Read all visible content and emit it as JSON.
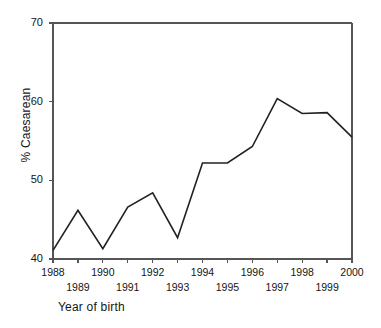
{
  "chart_data": {
    "type": "line",
    "title": "",
    "xlabel": "Year of birth",
    "ylabel": "% Caesarean",
    "x": [
      1988,
      1989,
      1990,
      1991,
      1992,
      1993,
      1994,
      1995,
      1996,
      1997,
      1998,
      1999,
      2000
    ],
    "categories": [
      "1988",
      "1989",
      "1990",
      "1991",
      "1992",
      "1993",
      "1994",
      "1995",
      "1996",
      "1997",
      "1998",
      "1999",
      "2000"
    ],
    "values": [
      41.1,
      46.2,
      41.3,
      46.6,
      48.4,
      42.7,
      52.2,
      52.2,
      54.3,
      60.4,
      58.5,
      58.6,
      55.5
    ],
    "series": [
      {
        "name": "% Caesarean",
        "values": [
          41.1,
          46.2,
          41.3,
          46.6,
          48.4,
          42.7,
          52.2,
          52.2,
          54.3,
          60.4,
          58.5,
          58.6,
          55.5
        ]
      }
    ],
    "ylim": [
      40,
      70
    ],
    "xlim": [
      1988,
      2000
    ],
    "yticks": [
      40,
      50,
      60,
      70
    ],
    "ytick_labels": [
      "40",
      "50",
      "60",
      "70"
    ],
    "xticks": [
      1988,
      1989,
      1990,
      1991,
      1992,
      1993,
      1994,
      1995,
      1996,
      1997,
      1998,
      1999,
      2000
    ],
    "xtick_labels": [
      "1988",
      "1989",
      "1990",
      "1991",
      "1992",
      "1993",
      "1994",
      "1995",
      "1996",
      "1997",
      "1998",
      "1999",
      "2000"
    ],
    "xtick_rows": [
      0,
      1,
      0,
      1,
      0,
      1,
      0,
      1,
      0,
      1,
      0,
      1,
      0
    ],
    "grid": false,
    "legend": false,
    "line_color": "#222222",
    "axis_color": "#555555"
  },
  "axes": {
    "y_title": "% Caesarean",
    "x_title": "Year of birth"
  }
}
